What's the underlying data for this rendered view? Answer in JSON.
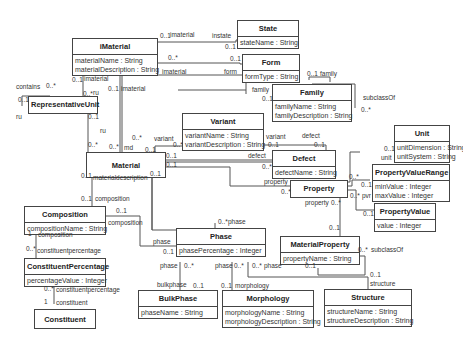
{
  "diagram": {
    "type": "UML class diagram",
    "classes": [
      {
        "id": "iMaterial",
        "name": "iMaterial",
        "attributes": [
          "materialName : String",
          "materialDescription : String"
        ]
      },
      {
        "id": "State",
        "name": "State",
        "attributes": [
          "stateName : String"
        ]
      },
      {
        "id": "Form",
        "name": "Form",
        "attributes": [
          "formType : String"
        ]
      },
      {
        "id": "Family",
        "name": "Family",
        "attributes": [
          "familyName : String",
          "familyDescription : String"
        ]
      },
      {
        "id": "RepresentativeUnit",
        "name": "RepresentativeUnit",
        "attributes": []
      },
      {
        "id": "Variant",
        "name": "Variant",
        "attributes": [
          "variantName : String",
          "variantDescription : String"
        ]
      },
      {
        "id": "Material",
        "name": "Material",
        "attributes": []
      },
      {
        "id": "Defect",
        "name": "Defect",
        "attributes": [
          "defectName : String"
        ]
      },
      {
        "id": "Unit",
        "name": "Unit",
        "attributes": [
          "unitDimension : String",
          "unitSystem : String"
        ]
      },
      {
        "id": "PropertyValueRange",
        "name": "PropertyValueRange",
        "attributes": [
          "minValue : Integer",
          "maxValue : Integer"
        ]
      },
      {
        "id": "Property",
        "name": "Property",
        "attributes": []
      },
      {
        "id": "PropertyValue",
        "name": "PropertyValue",
        "attributes": [
          "value : Integer"
        ]
      },
      {
        "id": "Composition",
        "name": "Composition",
        "attributes": [
          "compositionName : String"
        ]
      },
      {
        "id": "ConstituentPercentage",
        "name": "ConstituentPercentage",
        "attributes": [
          "percentageValue : Integer"
        ]
      },
      {
        "id": "Constituent",
        "name": "Constituent",
        "attributes": []
      },
      {
        "id": "Phase",
        "name": "Phase",
        "attributes": [
          "phasePercentage : Integer"
        ]
      },
      {
        "id": "MaterialProperty",
        "name": "MaterialProperty",
        "attributes": [
          "propertyName : String"
        ]
      },
      {
        "id": "BulkPhase",
        "name": "BulkPhase",
        "attributes": [
          "phaseName : String"
        ]
      },
      {
        "id": "Morphology",
        "name": "Morphology",
        "attributes": [
          "morphologyName : String",
          "morphologyDescription : String"
        ]
      },
      {
        "id": "Structure",
        "name": "Structure",
        "attributes": [
          "structureName : String",
          "structureDescription : String"
        ]
      }
    ],
    "labels": {
      "l_imaterial_state": "imaterial",
      "l_01_a": "0..1",
      "l_instate": "instate",
      "l_01_state": "0..1",
      "l_0star_form": "0..*",
      "l_imaterial_form": "imaterial",
      "l_01_form": "0..1",
      "l_form": "form",
      "l_01_family_self": "0..1",
      "l_family_self": "family",
      "l_family": "family",
      "l_01_family": "0..1",
      "l_subclassof_family": "subclassOf",
      "l_0star_family": "0..*",
      "l_contains": "contains",
      "l_0star_contains": "0..*",
      "l_01_ru_left": "0..1",
      "l_ru_left": "ru",
      "l_01_imat": "0..1",
      "l_imaterial_ru": "imaterial",
      "l_0star_ru": "0..*",
      "l_ru_top": "ru",
      "l_01_imat2": "0..1",
      "l_imaterial2": "imaterial",
      "l_01_ru_bottom": "0..1",
      "l_ru_mid": "ru",
      "l_0star_mat_ru": "0..*",
      "l_0star_md": "0..*",
      "l_md": "md",
      "l_0star_fam_mat": "0..*",
      "l_variant": "variant",
      "l_01_variant": "0..1",
      "l_0star_variant": "0..*",
      "l_01_mat_defect": "0..1",
      "l_01_mat_prop": "0..1",
      "l_variant2": "variant",
      "l_01_variant2": "0..1",
      "l_defect_top": "defect",
      "l_01_defect_top": "0..1",
      "l_defect": "defect",
      "l_0star_defect": "0..*",
      "l_01_matdesc": "0..1",
      "l_materialdescription": "materialdescription",
      "l_01_matdesc2": "0..1",
      "l_property": "property",
      "l_0star_property": "0..*",
      "l_property2": "property",
      "l_0star_property2": "0..*",
      "l_01_unit": "0..1",
      "l_unit": "unit",
      "l_0star_unit": "0..*",
      "l_01_pvr": "0..1",
      "l_pvr": "pvr",
      "l_0star_pv": "0..*",
      "l_01_pv": "0..1",
      "l_01_comp": "0..1",
      "l_composition_top": "composition",
      "l_01_comp_phase": "0..1",
      "l_composition_right": "composition",
      "l_1_comp": "1",
      "l_composition_cp": "composition",
      "l_0star_cp": "0..*",
      "l_constituentpercentage": "constituentpercentage",
      "l_0star_cp2": "0..*",
      "l_constituentpercentage2": "constituentpercentage",
      "l_1_const": "1",
      "l_constituent": "constituent",
      "l_0star_phase": "0..*",
      "l_phase_top": "phase",
      "l_phase_left": "phase",
      "l_01_phase_left": "0..1",
      "l_phase_bulk": "phase",
      "l_0star_bulk": "0..*",
      "l_phase_morph": "phase",
      "l_0star_morph": "0..*",
      "l_0star_struct": "0..*",
      "l_phase_struct": "phase",
      "l_bulkphase": "bulkphase",
      "l_01_bulk": "0..1",
      "l_01_morph": "0..1",
      "l_morphology": "morphology",
      "l_01_mp": "0..1",
      "l_01_mp2": "0..1",
      "l_0star_mp_sub": "0..*",
      "l_subclassof_mp": "subclassOf",
      "l_01_struct": "0..1",
      "l_structure": "structure"
    }
  }
}
